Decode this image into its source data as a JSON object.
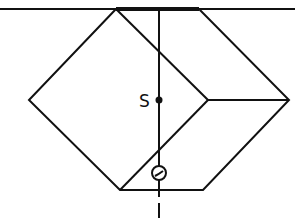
{
  "diagram": {
    "title": "",
    "labels": {
      "center_of_gravity": "S"
    },
    "colors": {
      "stroke": "#111111",
      "background": "#ffffff"
    },
    "surface_line": {
      "x1": 0,
      "y1": 9,
      "x2": 295,
      "y2": 9
    },
    "contact_segment": {
      "x1": 116,
      "y1": 9,
      "x2": 199,
      "y2": 9
    },
    "outline_points": "116,9 29,100 120,190 203,190 289,100 199,9",
    "inner_edges": [
      {
        "x1": 116,
        "y1": 9,
        "x2": 208,
        "y2": 100
      },
      {
        "x1": 208,
        "y1": 100,
        "x2": 289,
        "y2": 100
      },
      {
        "x1": 208,
        "y1": 100,
        "x2": 120,
        "y2": 190
      }
    ],
    "vertical_axis": {
      "x": 159,
      "y1": 9,
      "y2": 190
    },
    "axis_extension": {
      "x": 159,
      "y1": 190,
      "y2": 197,
      "dash_y1": 203,
      "dash_y2": 218
    },
    "center_point": {
      "cx": 159,
      "cy": 100,
      "r": 3.5
    },
    "pivot_circle": {
      "cx": 159,
      "cy": 173,
      "r": 7
    },
    "label_position": {
      "x": 139,
      "y": 107
    }
  }
}
